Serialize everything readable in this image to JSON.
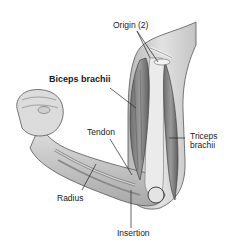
{
  "figure": {
    "labels": {
      "origin": "Origin (2)",
      "biceps": "Biceps brachii",
      "tendon": "Tendon",
      "triceps_line1": "Triceps",
      "triceps_line2": "brachii",
      "radius": "Radius",
      "insertion": "Insertion"
    }
  }
}
